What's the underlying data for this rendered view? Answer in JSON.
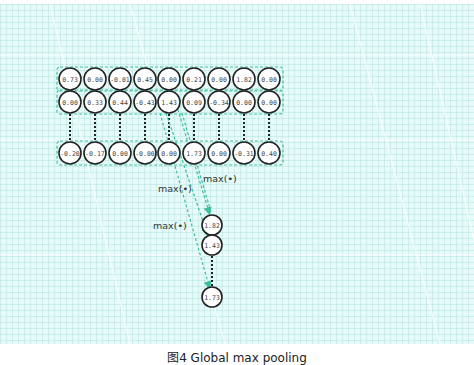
{
  "figure": {
    "caption": "图4 Global max pooling"
  },
  "colors": {
    "background": "#e6fbf9",
    "accent_dashed": "#3fbf9f",
    "node_stroke": "#222222",
    "node_fill": "#ffffff"
  },
  "input_rows": [
    [
      "0.73",
      "0.00",
      "-0.01",
      "0.45",
      "0.00",
      "0.21",
      "0.00",
      "1.82",
      "0.00"
    ],
    [
      "0.00",
      "0.33",
      "0.44",
      "-0.43",
      "1.43",
      "0.09",
      "-0.34",
      "0.00",
      "0.00"
    ],
    [
      "-0.20",
      "-0.17",
      "0.00",
      "-0.00",
      "0.00",
      "1.73",
      "0.00",
      "-0.31",
      "0.40"
    ]
  ],
  "operation_labels": [
    "max(•)",
    "max(•)",
    "max(•)"
  ],
  "output_nodes": [
    "1.82",
    "1.43",
    "1.73"
  ]
}
